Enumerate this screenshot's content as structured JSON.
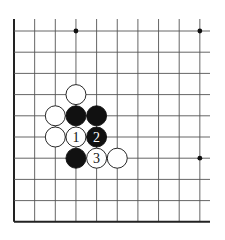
{
  "diagram": {
    "type": "go-board-fragment",
    "grid": {
      "x0": 14,
      "y0": 31,
      "dx": 20.65,
      "dy": 21.2,
      "cols": 10,
      "rows": 10,
      "right_extent": 210,
      "left_edge_thick": true,
      "bottom_edge_thick": true,
      "top_open": true,
      "right_open": true,
      "line_color": "#555555",
      "edge_color": "#222222"
    },
    "hoshi": [
      {
        "col": 3,
        "row": 0
      },
      {
        "col": 9,
        "row": 0
      },
      {
        "col": 9,
        "row": 6
      }
    ],
    "stones": [
      {
        "col": 3,
        "row": 3,
        "color": "white",
        "label": ""
      },
      {
        "col": 2,
        "row": 4,
        "color": "white",
        "label": ""
      },
      {
        "col": 3,
        "row": 4,
        "color": "black",
        "label": ""
      },
      {
        "col": 4,
        "row": 4,
        "color": "black",
        "label": ""
      },
      {
        "col": 2,
        "row": 5,
        "color": "white",
        "label": ""
      },
      {
        "col": 3,
        "row": 5,
        "color": "white",
        "label": "1"
      },
      {
        "col": 4,
        "row": 5,
        "color": "black",
        "label": "2"
      },
      {
        "col": 3,
        "row": 6,
        "color": "black",
        "label": ""
      },
      {
        "col": 4,
        "row": 6,
        "color": "white",
        "label": "3"
      },
      {
        "col": 5,
        "row": 6,
        "color": "white",
        "label": ""
      }
    ]
  }
}
